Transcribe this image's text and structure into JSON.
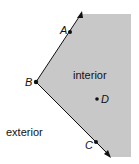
{
  "diagram": {
    "colors": {
      "interior_fill": "#c8c8c8",
      "ray": "#111111",
      "background": "#ffffff"
    },
    "angle": {
      "vertex": "B",
      "rays": [
        "BA",
        "BC"
      ]
    },
    "points": [
      {
        "name": "A",
        "role": "point on ray BA"
      },
      {
        "name": "B",
        "role": "vertex"
      },
      {
        "name": "C",
        "role": "point on ray BC"
      },
      {
        "name": "D",
        "role": "point in interior"
      }
    ],
    "labels": {
      "interior": "interior",
      "exterior": "exterior",
      "A": "A",
      "B": "B",
      "C": "C",
      "D": "D"
    }
  }
}
